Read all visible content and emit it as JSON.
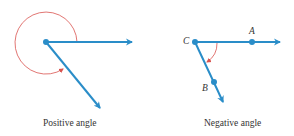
{
  "diagrams": [
    {
      "caption": "Positive angle",
      "labels": []
    },
    {
      "caption": "Negative angle",
      "labels": {
        "vertex": "C",
        "initial_point": "A",
        "terminal_point": "B"
      }
    }
  ],
  "colors": {
    "ray": "#2a8dc8",
    "arc": "#d9534f",
    "text": "#333333"
  }
}
